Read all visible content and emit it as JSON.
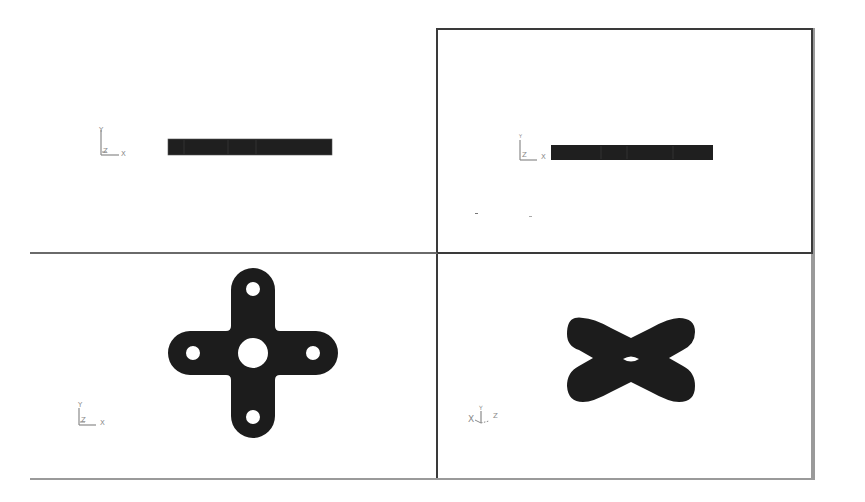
{
  "figure": {
    "colors": {
      "solid_fill": "#1c1c1c",
      "frame_border": "#3a3a3a",
      "outer_border": "#9a9a9a",
      "triad": "#8a8a8a",
      "background": "#ffffff"
    },
    "viewports": [
      {
        "id": "top-left",
        "view": "front edge view",
        "shape": "thin-bar",
        "triad": {
          "up": "Y",
          "right": "X",
          "origin": "Z"
        }
      },
      {
        "id": "top-right",
        "view": "side edge view",
        "shape": "thin-bar",
        "triad": {
          "up": "Y",
          "right": "X",
          "origin": "Z"
        }
      },
      {
        "id": "bottom-left",
        "view": "plan view",
        "shape": "cross-plate-with-5-holes",
        "triad": {
          "up": "Y",
          "right": "X",
          "origin": "Z"
        }
      },
      {
        "id": "bottom-right",
        "view": "perspective view",
        "shape": "bowtie-plate",
        "triad": {
          "up": "Y",
          "right": "Z",
          "left": "X"
        }
      }
    ]
  }
}
